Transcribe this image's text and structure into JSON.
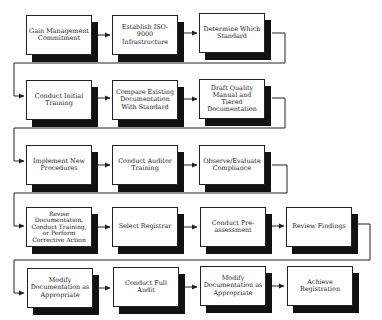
{
  "diagram": {
    "type": "flowchart",
    "title": "",
    "rows": [
      {
        "steps": [
          {
            "id": "s1",
            "label": "Gain Management Commitment"
          },
          {
            "id": "s2",
            "label": "Establish ISO-9000 Infrastructure"
          },
          {
            "id": "s3",
            "label": "Determine Which Standard"
          }
        ]
      },
      {
        "steps": [
          {
            "id": "s4",
            "label": "Conduct Initial Training"
          },
          {
            "id": "s5",
            "label": "Compare Existing Documentation With Standard"
          },
          {
            "id": "s6",
            "label": "Draft Quality Manual and Tiered Documentation"
          }
        ]
      },
      {
        "steps": [
          {
            "id": "s7",
            "label": "Implement New Procedures"
          },
          {
            "id": "s8",
            "label": "Conduct Auditor Training"
          },
          {
            "id": "s9",
            "label": "Observe/Evaluate Compliance"
          }
        ]
      },
      {
        "steps": [
          {
            "id": "s10",
            "label": "Revise Documentation, Conduct Training, or Perform Corrective Action"
          },
          {
            "id": "s11",
            "label": "Select Registrar"
          },
          {
            "id": "s12",
            "label": "Conduct Pre-assessment"
          },
          {
            "id": "s13",
            "label": "Review Findings"
          }
        ]
      },
      {
        "steps": [
          {
            "id": "s14",
            "label": "Modify Documentation as Appropriate"
          },
          {
            "id": "s15",
            "label": "Conduct Full Audit"
          },
          {
            "id": "s16",
            "label": "Modify Documentation as Appropriate"
          },
          {
            "id": "s17",
            "label": "Achieve Registration"
          }
        ]
      }
    ],
    "edges": [
      [
        "s1",
        "s2"
      ],
      [
        "s2",
        "s3"
      ],
      [
        "s3",
        "s4"
      ],
      [
        "s4",
        "s5"
      ],
      [
        "s5",
        "s6"
      ],
      [
        "s6",
        "s7"
      ],
      [
        "s7",
        "s8"
      ],
      [
        "s8",
        "s9"
      ],
      [
        "s9",
        "s10"
      ],
      [
        "s10",
        "s11"
      ],
      [
        "s11",
        "s12"
      ],
      [
        "s12",
        "s13"
      ],
      [
        "s13",
        "s14"
      ],
      [
        "s14",
        "s15"
      ],
      [
        "s15",
        "s16"
      ],
      [
        "s16",
        "s17"
      ]
    ],
    "colors": {
      "line": "#222222",
      "shadow": "#111111",
      "box": "#ffffff"
    }
  }
}
